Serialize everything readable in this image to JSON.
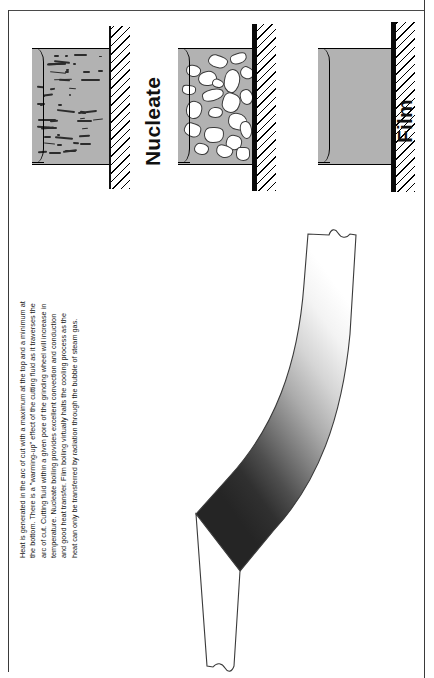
{
  "figure": {
    "background_color": "#ffffff",
    "frame_color": "#3a3a3a"
  },
  "panels": [
    {
      "id": "convection",
      "label": "",
      "fluid_color": "#b2b2b2",
      "wall_style": "thin",
      "wall_color": "#111111",
      "content": "small-dashes",
      "description": "Fluid layer with small dispersed dashes against a thin hatched wall"
    },
    {
      "id": "nucleate",
      "label": "Nucleate",
      "fluid_color": "#b2b2b2",
      "wall_style": "thick",
      "wall_color": "#0a0a0a",
      "content": "white-bubbles",
      "description": "Fluid layer with large white vapour bubbles against a thick hatched wall"
    },
    {
      "id": "film",
      "label": "Film",
      "fluid_color": "#b2b2b2",
      "wall_style": "thick",
      "wall_color": "#0a0a0a",
      "content": "solid-film",
      "description": "Continuous vapour film layer against a thick hatched wall"
    }
  ],
  "caption": {
    "text": "Heat is generated in the arc of cut with a maximum at the top and a minimum at the bottom. There is a \"warming-up\" effect of the cutting fluid as it traverses the arc of cut. Cutting fluid within a given pore of the grinding wheel will increase in temperature. Nucleate boiling provides excellent convection and conduction and good heat transfer. Film boiling virtually halts the cooling process as the heat can only be transferred by radiation through the bubble of steam gas.",
    "orientation": "rotated-90-ccw"
  },
  "band": {
    "name": "arc-of-cut-band",
    "description": "Curved band showing the heat gradient along the arc of cut",
    "gradient_from": "#ffffff",
    "gradient_to": "#262626",
    "outline_color": "#3a3a3a",
    "hot_end": "bottom",
    "cool_end": "top"
  },
  "icons": {
    "hatch": "hatch-pattern-icon",
    "bubble": "vapour-bubble-icon",
    "dash": "micro-bubble-icon"
  }
}
